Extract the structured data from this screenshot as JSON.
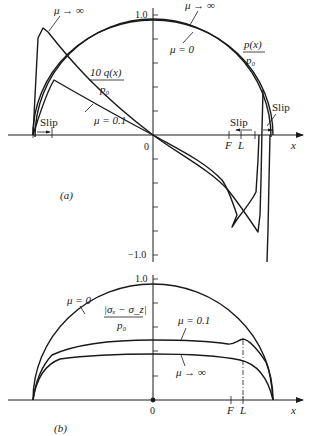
{
  "panel_a": {
    "caption": "(a)",
    "y_tick_top": "1.0",
    "y_tick_bottom": "−1.0",
    "origin": "0",
    "x_axis_label": "x",
    "F_label": "F",
    "L_label": "L",
    "labels": {
      "mu_inf_left": "μ → ∞",
      "mu_inf_top": "μ → ∞",
      "mu_zero": "μ = 0",
      "mu_01": "μ = 0.1",
      "shear_num": "10 q(x)",
      "shear_den": "p₀",
      "pressure_num": "p(x)",
      "pressure_den": "p₀",
      "slip_left": "Slip",
      "slip_mid": "Slip",
      "slip_right": "Slip"
    }
  },
  "panel_b": {
    "caption": "(b)",
    "y_tick_top": "1.0",
    "origin": "0",
    "x_axis_label": "x",
    "F_label": "F",
    "L_label": "L",
    "labels": {
      "mu_zero": "μ = 0",
      "mu_01": "μ = 0.1",
      "mu_inf": "μ → ∞",
      "stress_num": "|σₓ − σ_z|",
      "stress_den": "p₀"
    }
  }
}
